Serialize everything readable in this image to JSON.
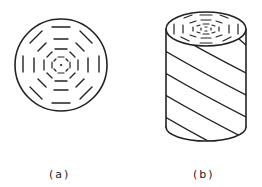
{
  "figure": {
    "panels": [
      {
        "id": "a",
        "label": "(a)",
        "description": "cross-section circle with concentric octagonal dashed rings"
      },
      {
        "id": "b",
        "label": "(b)",
        "description": "cylinder with helical striations on side and concentric rings on top face"
      }
    ],
    "stroke_color": "#222222",
    "background": "#ffffff"
  }
}
